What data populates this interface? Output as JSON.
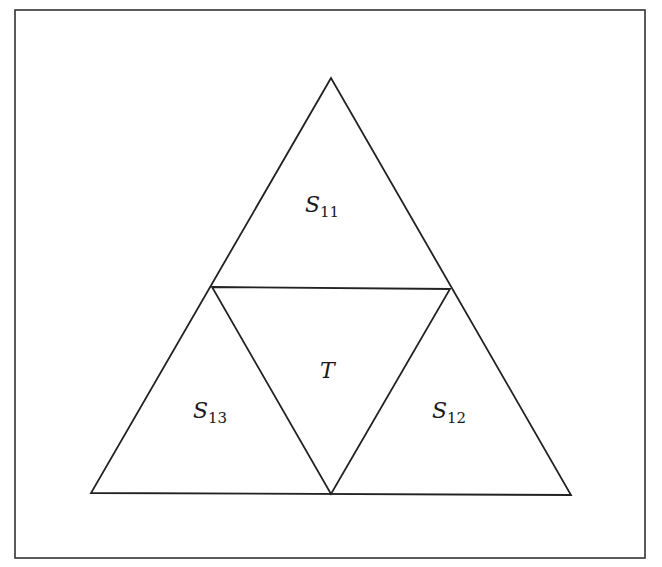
{
  "diagram": {
    "frame": {
      "x": 15,
      "y": 10,
      "width": 630,
      "height": 548,
      "stroke": "#333333"
    },
    "stroke_color": "#222222",
    "vertices": {
      "top": [
        331,
        78
      ],
      "left": [
        91,
        493
      ],
      "right": [
        571,
        495
      ],
      "mid_left": [
        212,
        287
      ],
      "mid_right": [
        450,
        289
      ],
      "mid_bottom": [
        331,
        494
      ]
    },
    "regions": [
      {
        "id": "S11",
        "base": "S",
        "sub": "11",
        "pos": [
          305,
          212
        ]
      },
      {
        "id": "T",
        "base": "T",
        "sub": "",
        "pos": [
          320,
          378
        ]
      },
      {
        "id": "S13",
        "base": "S",
        "sub": "13",
        "pos": [
          193,
          418
        ]
      },
      {
        "id": "S12",
        "base": "S",
        "sub": "12",
        "pos": [
          432,
          418
        ]
      }
    ]
  }
}
